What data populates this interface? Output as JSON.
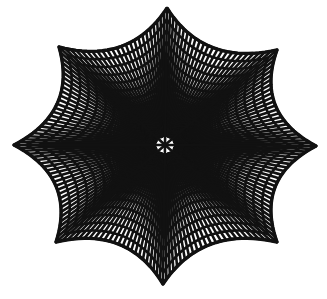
{
  "figure": {
    "title": "",
    "background": "#ffffff",
    "stroke_color": "#111111",
    "stroke_width": 2.6,
    "center": [
      165,
      145
    ],
    "vertices": [
      [
        167,
        8
      ],
      [
        277,
        50
      ],
      [
        316,
        146
      ],
      [
        277,
        242
      ],
      [
        163,
        284
      ],
      [
        56,
        242
      ],
      [
        14,
        145
      ],
      [
        59,
        47
      ]
    ],
    "edge_inward_bulge": 0.16,
    "grid_divisions": 12
  }
}
